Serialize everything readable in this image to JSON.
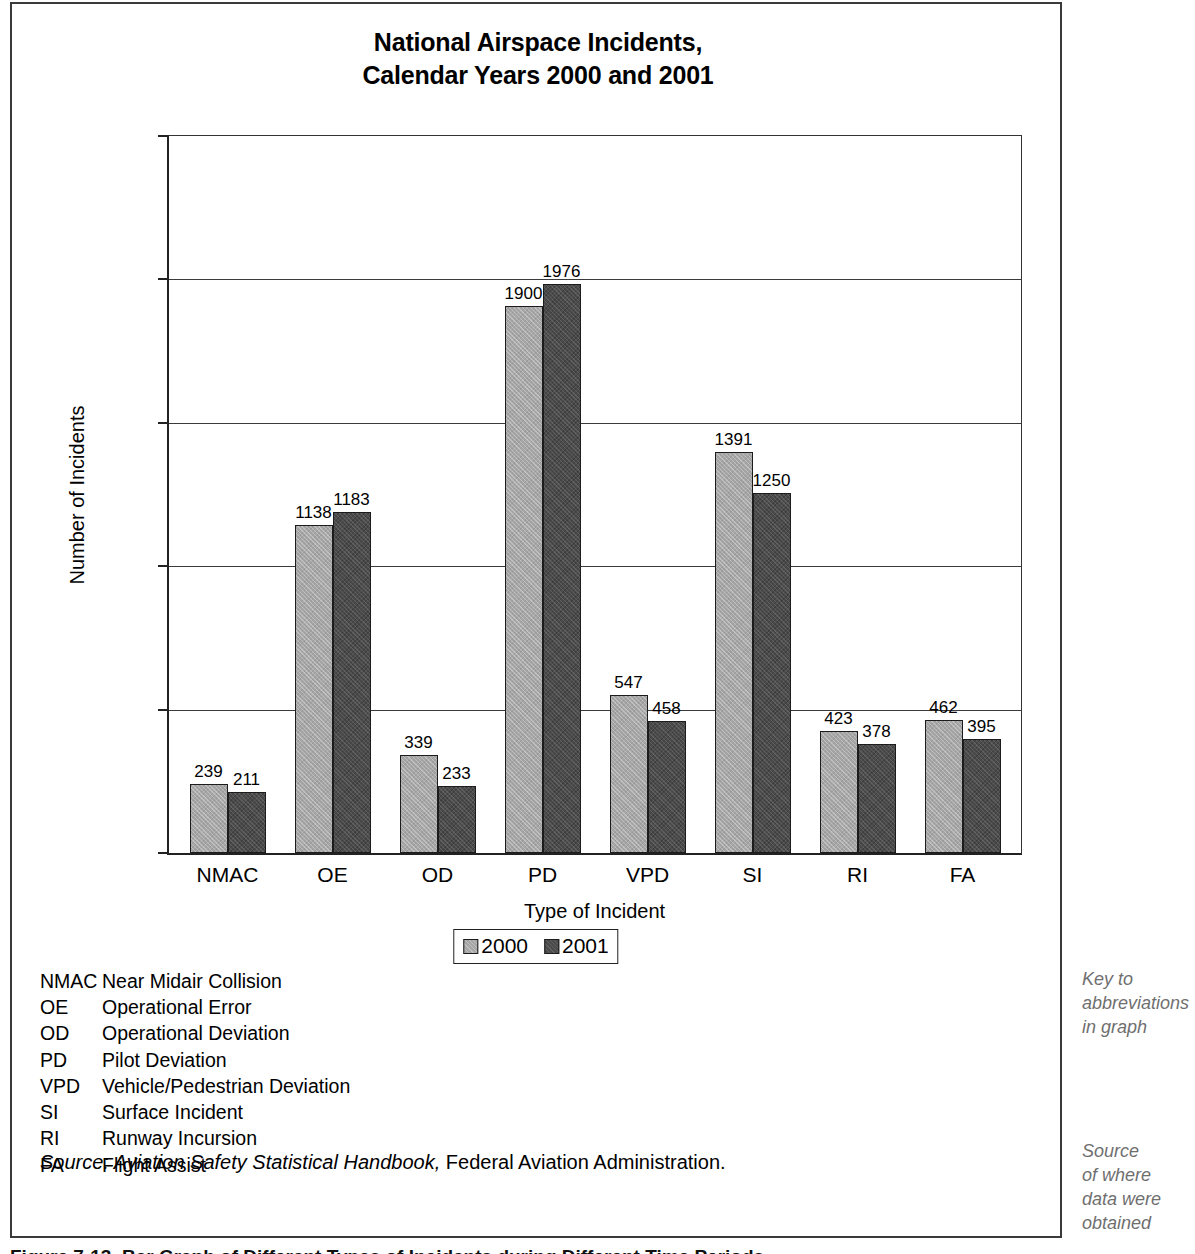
{
  "chart_data": {
    "type": "bar",
    "title": "National Airspace Incidents, Calendar Years 2000 and 2001",
    "title_line1": "National Airspace Incidents,",
    "title_line2": "Calendar Years 2000 and 2001",
    "xlabel": "Type of Incident",
    "ylabel": "Number of Incidents",
    "categories": [
      "NMAC",
      "OE",
      "OD",
      "PD",
      "VPD",
      "SI",
      "RI",
      "FA"
    ],
    "series": [
      {
        "name": "2000",
        "color": "#a6a6a6",
        "values": [
          239,
          1138,
          339,
          1900,
          547,
          1391,
          423,
          462
        ]
      },
      {
        "name": "2001",
        "color": "#4b4b4b",
        "values": [
          211,
          1183,
          233,
          1976,
          458,
          1250,
          378,
          395
        ]
      }
    ],
    "ylim": [
      0,
      2500
    ],
    "yticks": [
      0,
      500,
      1000,
      1500,
      2000,
      2500
    ],
    "ytick_labels": [
      "0",
      "500",
      "1000",
      "1500",
      "2000",
      "2500"
    ],
    "grid": true,
    "legend_position": "bottom-center"
  },
  "legend": {
    "items": [
      {
        "label": "2000",
        "swatch": "light-gray-swatch"
      },
      {
        "label": "2001",
        "swatch": "dark-gray-swatch"
      }
    ]
  },
  "abbreviations": [
    {
      "code": "NMAC",
      "description": "Near Midair Collision"
    },
    {
      "code": "OE",
      "description": "Operational Error"
    },
    {
      "code": "OD",
      "description": "Operational Deviation"
    },
    {
      "code": "PD",
      "description": "Pilot Deviation"
    },
    {
      "code": "VPD",
      "description": "Vehicle/Pedestrian Deviation"
    },
    {
      "code": "SI",
      "description": "Surface Incident"
    },
    {
      "code": "RI",
      "description": "Runway Incursion"
    },
    {
      "code": "FA",
      "description": "Flight Assist"
    }
  ],
  "source_note": {
    "italic_part": "Source: Aviation Safety Statistical Handbook,",
    "plain_part": " Federal Aviation Administration."
  },
  "margin_notes": {
    "key_note": "Key to\nabbreviations\nin graph",
    "key_note_lines": [
      "Key to",
      "abbreviations",
      "in graph"
    ],
    "source_note": "Source\nof where\ndata were\nobtained",
    "source_note_lines": [
      "Source",
      "of where",
      "data were",
      "obtained"
    ]
  },
  "figure_caption": "Figure 7-13.  Bar Graph of Different Types of Incidents during Different Time Periods",
  "colors": {
    "series_2000": "#a6a6a6",
    "series_2001": "#4b4b4b",
    "axis": "#222222",
    "margin_note_text": "#6f6f6f",
    "background": "#ffffff"
  }
}
